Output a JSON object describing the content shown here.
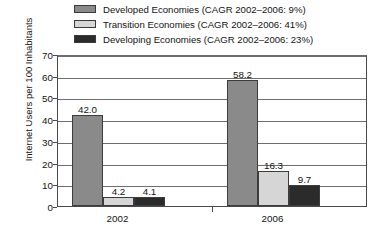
{
  "chart_data": {
    "type": "bar",
    "title": "",
    "xlabel": "",
    "ylabel": "Internet Users per 100 Inhabitants",
    "categories": [
      "2002",
      "2006"
    ],
    "ylim": [
      0,
      70
    ],
    "yticks": [
      0,
      10,
      20,
      30,
      40,
      50,
      60,
      70
    ],
    "ytick_labels": [
      "0",
      "10",
      "20",
      "30",
      "40",
      "50",
      "60",
      "70"
    ],
    "grid": true,
    "legend_position": "top",
    "series": [
      {
        "name": "Developed Economies (CAGR 2002–2006: 9%)",
        "short_name": "Developed Economies",
        "cagr": "9%",
        "color": "#8a8a8a",
        "values": [
          42.0,
          58.2
        ],
        "labels": [
          "42.0",
          "58.2"
        ]
      },
      {
        "name": "Transition Economies (CAGR 2002–2006: 41%)",
        "short_name": "Transition Economies",
        "cagr": "41%",
        "color": "#d6d6d6",
        "values": [
          4.2,
          16.3
        ],
        "labels": [
          "4.2",
          "16.3"
        ]
      },
      {
        "name": "Developing Economies (CAGR 2002–2006: 23%)",
        "short_name": "Developing Economies",
        "cagr": "23%",
        "color": "#2b2b2b",
        "values": [
          4.1,
          9.7
        ],
        "labels": [
          "4.1",
          "9.7"
        ]
      }
    ]
  },
  "legend": {
    "items": [
      {
        "label": "Developed Economies (CAGR 2002–2006: 9%)",
        "color": "#8a8a8a"
      },
      {
        "label": "Transition Economies (CAGR 2002–2006: 41%)",
        "color": "#d6d6d6"
      },
      {
        "label": "Developing Economies (CAGR 2002–2006: 23%)",
        "color": "#2b2b2b"
      }
    ]
  },
  "axes": {
    "y_title": "Internet Users per 100 Inhabitants",
    "y_ticks": [
      "70",
      "60",
      "50",
      "40",
      "30",
      "20",
      "10",
      "0"
    ],
    "x_ticks": [
      "2002",
      "2006"
    ]
  }
}
